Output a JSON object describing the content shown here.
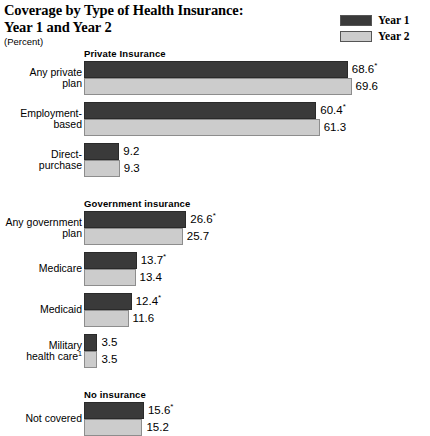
{
  "header": {
    "title_line1": "Coverage by Type of Health Insurance:",
    "title_line2": "Year 1 and Year 2",
    "subtitle": "(Percent)"
  },
  "legend": {
    "items": [
      {
        "label": "Year 1",
        "color": "#3a3a3a",
        "swatch_name": "legend-swatch-year1"
      },
      {
        "label": "Year 2",
        "color": "#cccccc",
        "swatch_name": "legend-swatch-year2"
      }
    ]
  },
  "chart_data": {
    "type": "bar",
    "orientation": "horizontal",
    "title": "Coverage by Type of Health Insurance: Year 1 and Year 2",
    "subtitle": "(Percent)",
    "xlabel": "",
    "ylabel": "",
    "units": "percent",
    "grid": false,
    "legend_position": "top-right",
    "xlim": [
      0,
      72
    ],
    "series": [
      {
        "name": "Year 1",
        "color": "#3a3a3a"
      },
      {
        "name": "Year 2",
        "color": "#cccccc"
      }
    ],
    "sections": [
      {
        "heading": "Private Insurance",
        "categories": [
          {
            "label_line1": "Any private",
            "label_line2": "plan",
            "footnote": "",
            "year1": 9.2,
            "year2": 9.3,
            "year1_text": "68.6",
            "year1_marker": "*",
            "year2_text": "69.6",
            "year2_marker": "",
            "v1": 68.6,
            "v2": 69.6
          },
          {
            "label_line1": "Employment-",
            "label_line2": "based",
            "footnote": "",
            "year1_text": "60.4",
            "year1_marker": "*",
            "year2_text": "61.3",
            "year2_marker": "",
            "v1": 60.4,
            "v2": 61.3
          },
          {
            "label_line1": "Direct-",
            "label_line2": "purchase",
            "footnote": "",
            "year1_text": "9.2",
            "year1_marker": "",
            "year2_text": "9.3",
            "year2_marker": "",
            "v1": 9.2,
            "v2": 9.3
          }
        ]
      },
      {
        "heading": "Government insurance",
        "categories": [
          {
            "label_line1": "Any government",
            "label_line2": "plan",
            "footnote": "",
            "year1_text": "26.6",
            "year1_marker": "*",
            "year2_text": "25.7",
            "year2_marker": "",
            "v1": 26.6,
            "v2": 25.7
          },
          {
            "label_line1": "Medicare",
            "label_line2": "",
            "footnote": "",
            "year1_text": "13.7",
            "year1_marker": "*",
            "year2_text": "13.4",
            "year2_marker": "",
            "v1": 13.7,
            "v2": 13.4
          },
          {
            "label_line1": "Medicaid",
            "label_line2": "",
            "footnote": "",
            "year1_text": "12.4",
            "year1_marker": "*",
            "year2_text": "11.6",
            "year2_marker": "",
            "v1": 12.4,
            "v2": 11.6
          },
          {
            "label_line1": "Military",
            "label_line2": "health care",
            "footnote": "1",
            "year1_text": "3.5",
            "year1_marker": "",
            "year2_text": "3.5",
            "year2_marker": "",
            "v1": 3.5,
            "v2": 3.5
          }
        ]
      },
      {
        "heading": "No insurance",
        "categories": [
          {
            "label_line1": "Not covered",
            "label_line2": "",
            "footnote": "",
            "year1_text": "15.6",
            "year1_marker": "*",
            "year2_text": "15.2",
            "year2_marker": "",
            "v1": 15.6,
            "v2": 15.2
          }
        ]
      }
    ]
  }
}
